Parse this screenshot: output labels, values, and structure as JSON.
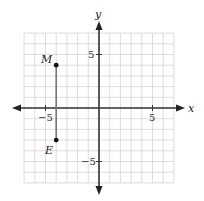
{
  "diagram": {
    "type": "coordinate-plane",
    "axes": {
      "x_label": "x",
      "y_label": "y",
      "x_range": [
        -7,
        7
      ],
      "y_range": [
        -7,
        7
      ],
      "grid_step": 1
    },
    "tick_labels": {
      "x_neg": "−5",
      "x_pos": "5",
      "y_pos": "5",
      "y_neg": "−5"
    },
    "points": [
      {
        "label": "M",
        "x": -4,
        "y": 4
      },
      {
        "label": "E",
        "x": -4,
        "y": -3
      }
    ],
    "segments": [
      {
        "from": "M",
        "to": "E"
      }
    ],
    "colors": {
      "grid": "#d4d4d4",
      "axis": "#333333",
      "segment": "#777777",
      "point": "#111111"
    }
  }
}
